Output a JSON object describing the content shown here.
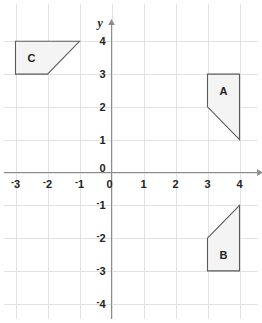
{
  "chart_data": {
    "type": "scatter",
    "title": "",
    "xlabel": "x",
    "ylabel": "y",
    "xlim": [
      -3.3,
      4.7
    ],
    "ylim": [
      -4.6,
      4.6
    ],
    "grid": true,
    "legend": "none",
    "x_ticks": [
      "-3",
      "-2",
      "-1",
      "0",
      "1",
      "2",
      "3",
      "4"
    ],
    "x_tick_values": [
      -3,
      -2,
      -1,
      0,
      1,
      2,
      3,
      4
    ],
    "y_ticks": [
      "0",
      "1",
      "2",
      "3",
      "4",
      "-1",
      "-2",
      "-3",
      "-4"
    ],
    "y_tick_values": [
      0,
      1,
      2,
      3,
      4,
      -1,
      -2,
      -3,
      -4
    ],
    "origin_label_x": "0",
    "origin_label_y": "0",
    "shapes": [
      {
        "label": "A",
        "vertices": [
          [
            3,
            3
          ],
          [
            4,
            3
          ],
          [
            4,
            1
          ],
          [
            3,
            2
          ]
        ],
        "label_at": [
          3.5,
          2.5
        ],
        "fill": "#f4f4f4",
        "stroke": "#5b5b5b"
      },
      {
        "label": "B",
        "vertices": [
          [
            3,
            -2
          ],
          [
            4,
            -1
          ],
          [
            4,
            -3
          ],
          [
            3,
            -3
          ]
        ],
        "label_at": [
          3.5,
          -2.5
        ],
        "fill": "#f4f4f4",
        "stroke": "#5b5b5b"
      },
      {
        "label": "C",
        "vertices": [
          [
            -3,
            4
          ],
          [
            -1,
            4
          ],
          [
            -2,
            3
          ],
          [
            -3,
            3
          ]
        ],
        "label_at": [
          -2.5,
          3.5
        ],
        "fill": "#f4f4f4",
        "stroke": "#5b5b5b"
      }
    ],
    "colors": {
      "background": "#ffffff",
      "grid": "#e2e2e2",
      "axis": "#8d8d8d",
      "shape_fill": "#f4f4f4",
      "shape_stroke": "#5b5b5b",
      "text": "#232323"
    }
  }
}
